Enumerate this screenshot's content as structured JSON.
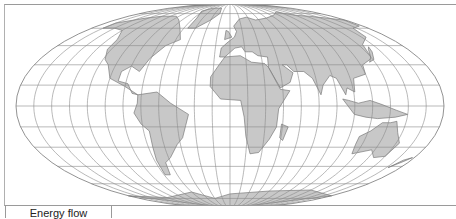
{
  "map": {
    "projection": "Mollweide",
    "graticule_step_deg": 15,
    "colors": {
      "land": "#c8c8c8",
      "land_stroke": "#6a6a6a",
      "graticule": "#8a8a8a",
      "outline": "#777777"
    },
    "regions": [
      {
        "name": "North America",
        "coords": [
          [
            -165,
            65
          ],
          [
            -140,
            70
          ],
          [
            -120,
            72
          ],
          [
            -95,
            72
          ],
          [
            -80,
            68
          ],
          [
            -65,
            60
          ],
          [
            -55,
            50
          ],
          [
            -67,
            45
          ],
          [
            -76,
            35
          ],
          [
            -81,
            25
          ],
          [
            -90,
            29
          ],
          [
            -97,
            25
          ],
          [
            -97,
            18
          ],
          [
            -88,
            16
          ],
          [
            -83,
            9
          ],
          [
            -78,
            8
          ],
          [
            -90,
            14
          ],
          [
            -105,
            20
          ],
          [
            -112,
            30
          ],
          [
            -118,
            34
          ],
          [
            -124,
            42
          ],
          [
            -125,
            50
          ],
          [
            -135,
            58
          ],
          [
            -150,
            60
          ],
          [
            -165,
            60
          ]
        ]
      },
      {
        "name": "Greenland",
        "coords": [
          [
            -55,
            60
          ],
          [
            -45,
            60
          ],
          [
            -30,
            68
          ],
          [
            -20,
            75
          ],
          [
            -25,
            82
          ],
          [
            -50,
            82
          ],
          [
            -65,
            78
          ],
          [
            -55,
            70
          ]
        ]
      },
      {
        "name": "South America",
        "coords": [
          [
            -78,
            8
          ],
          [
            -62,
            10
          ],
          [
            -50,
            2
          ],
          [
            -35,
            -6
          ],
          [
            -38,
            -14
          ],
          [
            -42,
            -23
          ],
          [
            -48,
            -28
          ],
          [
            -58,
            -38
          ],
          [
            -65,
            -42
          ],
          [
            -68,
            -52
          ],
          [
            -74,
            -52
          ],
          [
            -73,
            -40
          ],
          [
            -71,
            -30
          ],
          [
            -70,
            -18
          ],
          [
            -76,
            -13
          ],
          [
            -81,
            -5
          ],
          [
            -78,
            2
          ]
        ]
      },
      {
        "name": "Europe-Asia",
        "coords": [
          [
            -10,
            36
          ],
          [
            -9,
            43
          ],
          [
            -2,
            48
          ],
          [
            5,
            52
          ],
          [
            8,
            57
          ],
          [
            5,
            62
          ],
          [
            15,
            69
          ],
          [
            28,
            71
          ],
          [
            40,
            68
          ],
          [
            60,
            70
          ],
          [
            80,
            73
          ],
          [
            100,
            77
          ],
          [
            120,
            73
          ],
          [
            140,
            72
          ],
          [
            160,
            70
          ],
          [
            178,
            68
          ],
          [
            175,
            62
          ],
          [
            160,
            60
          ],
          [
            155,
            52
          ],
          [
            140,
            46
          ],
          [
            135,
            35
          ],
          [
            122,
            30
          ],
          [
            120,
            23
          ],
          [
            108,
            20
          ],
          [
            106,
            10
          ],
          [
            100,
            13
          ],
          [
            98,
            8
          ],
          [
            93,
            20
          ],
          [
            88,
            22
          ],
          [
            80,
            15
          ],
          [
            77,
            8
          ],
          [
            72,
            20
          ],
          [
            66,
            25
          ],
          [
            57,
            25
          ],
          [
            52,
            30
          ],
          [
            48,
            30
          ],
          [
            56,
            24
          ],
          [
            52,
            17
          ],
          [
            43,
            13
          ],
          [
            35,
            28
          ],
          [
            36,
            36
          ],
          [
            27,
            37
          ],
          [
            22,
            40
          ],
          [
            15,
            40
          ],
          [
            12,
            44
          ],
          [
            5,
            43
          ],
          [
            -5,
            36
          ]
        ]
      },
      {
        "name": "Africa",
        "coords": [
          [
            -17,
            21
          ],
          [
            -10,
            30
          ],
          [
            -5,
            36
          ],
          [
            10,
            37
          ],
          [
            20,
            32
          ],
          [
            32,
            31
          ],
          [
            35,
            28
          ],
          [
            43,
            12
          ],
          [
            51,
            11
          ],
          [
            41,
            -2
          ],
          [
            40,
            -15
          ],
          [
            35,
            -24
          ],
          [
            27,
            -34
          ],
          [
            19,
            -35
          ],
          [
            14,
            -22
          ],
          [
            12,
            -8
          ],
          [
            9,
            4
          ],
          [
            -8,
            5
          ],
          [
            -17,
            14
          ]
        ]
      },
      {
        "name": "Madagascar",
        "coords": [
          [
            44,
            -13
          ],
          [
            50,
            -15
          ],
          [
            47,
            -25
          ],
          [
            44,
            -23
          ]
        ]
      },
      {
        "name": "Australia",
        "coords": [
          [
            114,
            -22
          ],
          [
            122,
            -18
          ],
          [
            130,
            -12
          ],
          [
            137,
            -12
          ],
          [
            142,
            -11
          ],
          [
            146,
            -19
          ],
          [
            153,
            -27
          ],
          [
            150,
            -37
          ],
          [
            140,
            -38
          ],
          [
            132,
            -32
          ],
          [
            116,
            -35
          ],
          [
            114,
            -28
          ]
        ]
      },
      {
        "name": "Indonesia",
        "coords": [
          [
            95,
            5
          ],
          [
            105,
            -6
          ],
          [
            115,
            -8
          ],
          [
            125,
            -9
          ],
          [
            140,
            -8
          ],
          [
            150,
            -6
          ],
          [
            140,
            -3
          ],
          [
            128,
            1
          ],
          [
            118,
            4
          ],
          [
            108,
            2
          ],
          [
            100,
            4
          ]
        ]
      },
      {
        "name": "Japan",
        "coords": [
          [
            130,
            32
          ],
          [
            136,
            34
          ],
          [
            141,
            40
          ],
          [
            143,
            44
          ],
          [
            140,
            42
          ],
          [
            135,
            36
          ]
        ]
      },
      {
        "name": "UK",
        "coords": [
          [
            -6,
            50
          ],
          [
            2,
            52
          ],
          [
            -2,
            57
          ],
          [
            -5,
            58
          ]
        ]
      },
      {
        "name": "New Zealand",
        "coords": [
          [
            167,
            -46
          ],
          [
            174,
            -41
          ],
          [
            178,
            -38
          ],
          [
            172,
            -40
          ]
        ]
      },
      {
        "name": "Antarctica",
        "coords": [
          [
            -180,
            -72
          ],
          [
            -120,
            -74
          ],
          [
            -60,
            -68
          ],
          [
            -30,
            -75
          ],
          [
            0,
            -70
          ],
          [
            60,
            -67
          ],
          [
            120,
            -66
          ],
          [
            180,
            -72
          ],
          [
            180,
            -90
          ],
          [
            -180,
            -90
          ]
        ]
      }
    ]
  },
  "tabs": [
    {
      "label": "Energy flow",
      "active": true
    }
  ]
}
